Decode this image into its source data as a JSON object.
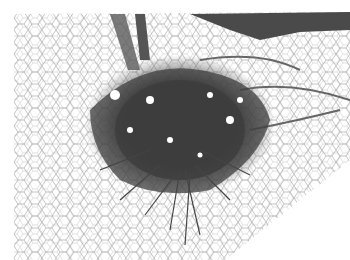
{
  "image": {
    "description": "Grayscale histology micrograph: dark dense fibrous/cellular mass centered in adipose tissue with white polygonal fat cells; tissue edge cuts diagonally at lower right",
    "colors": {
      "background": "#ffffff",
      "dense_tissue": "#3a3a3a",
      "fiber": "#555555",
      "septa": "#6a6a6a"
    }
  }
}
